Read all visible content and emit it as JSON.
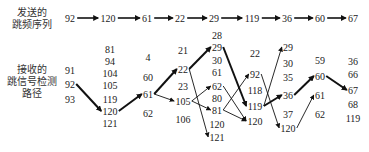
{
  "labels": {
    "sent": [
      "发送的",
      "跳频序列"
    ],
    "received": [
      "接收的",
      "跳信号检测",
      "路径"
    ]
  },
  "sent_sequence": {
    "y": 18,
    "nodes": [
      {
        "value": "92",
        "x": 70
      },
      {
        "value": "120",
        "x": 108
      },
      {
        "value": "61",
        "x": 147
      },
      {
        "value": "22",
        "x": 180
      },
      {
        "value": "29",
        "x": 214
      },
      {
        "value": "119",
        "x": 252
      },
      {
        "value": "36",
        "x": 287
      },
      {
        "value": "60",
        "x": 320
      },
      {
        "value": "67",
        "x": 353
      }
    ]
  },
  "columns": [
    {
      "x": 70,
      "values": [
        {
          "v": "91",
          "y": 70
        },
        {
          "v": "92",
          "y": 84
        },
        {
          "v": "93",
          "y": 99
        }
      ]
    },
    {
      "x": 110,
      "values": [
        {
          "v": "81",
          "y": 49
        },
        {
          "v": "94",
          "y": 61
        },
        {
          "v": "104",
          "y": 73
        },
        {
          "v": "105",
          "y": 85
        },
        {
          "v": "119",
          "y": 99
        },
        {
          "v": "120",
          "y": 111
        },
        {
          "v": "121",
          "y": 123
        }
      ]
    },
    {
      "x": 148,
      "values": [
        {
          "v": "4",
          "y": 57
        },
        {
          "v": "60",
          "y": 77
        },
        {
          "v": "61",
          "y": 94
        },
        {
          "v": "62",
          "y": 113
        }
      ]
    },
    {
      "x": 183,
      "values": [
        {
          "v": "21",
          "y": 50
        },
        {
          "v": "22",
          "y": 69
        },
        {
          "v": "23",
          "y": 86
        },
        {
          "v": "105",
          "y": 101
        },
        {
          "v": "106",
          "y": 119
        }
      ]
    },
    {
      "x": 217,
      "values": [
        {
          "v": "28",
          "y": 35
        },
        {
          "v": "29",
          "y": 47
        },
        {
          "v": "30",
          "y": 60
        },
        {
          "v": "61",
          "y": 72
        },
        {
          "v": "62",
          "y": 86
        },
        {
          "v": "80",
          "y": 98
        },
        {
          "v": "81",
          "y": 110
        },
        {
          "v": "120",
          "y": 124
        },
        {
          "v": "121",
          "y": 137
        }
      ]
    },
    {
      "x": 255,
      "values": [
        {
          "v": "22",
          "y": 53
        },
        {
          "v": "92",
          "y": 74
        },
        {
          "v": "118",
          "y": 90
        },
        {
          "v": "119",
          "y": 106
        },
        {
          "v": "120",
          "y": 121
        }
      ]
    },
    {
      "x": 288,
      "values": [
        {
          "v": "29",
          "y": 47
        },
        {
          "v": "30",
          "y": 63
        },
        {
          "v": "35",
          "y": 77
        },
        {
          "v": "36",
          "y": 95
        },
        {
          "v": "37",
          "y": 114
        },
        {
          "v": "120",
          "y": 128
        }
      ]
    },
    {
      "x": 320,
      "values": [
        {
          "v": "59",
          "y": 60
        },
        {
          "v": "60",
          "y": 76
        },
        {
          "v": "61",
          "y": 95
        },
        {
          "v": "62",
          "y": 114
        }
      ]
    },
    {
      "x": 353,
      "values": [
        {
          "v": "36",
          "y": 61
        },
        {
          "v": "66",
          "y": 74
        },
        {
          "v": "67",
          "y": 90
        },
        {
          "v": "68",
          "y": 104
        },
        {
          "v": "119",
          "y": 118
        }
      ]
    }
  ],
  "edges": [
    {
      "from": [
        0,
        1
      ],
      "to": [
        1,
        5
      ],
      "thick": true
    },
    {
      "from": [
        1,
        5
      ],
      "to": [
        2,
        2
      ],
      "thick": true
    },
    {
      "from": [
        2,
        2
      ],
      "to": [
        3,
        1
      ],
      "thick": true
    },
    {
      "from": [
        2,
        2
      ],
      "to": [
        3,
        3
      ],
      "thick": false
    },
    {
      "from": [
        3,
        1
      ],
      "to": [
        4,
        1
      ],
      "thick": true
    },
    {
      "from": [
        3,
        1
      ],
      "to": [
        4,
        8
      ],
      "thick": false
    },
    {
      "from": [
        3,
        3
      ],
      "to": [
        4,
        4
      ],
      "thick": false
    },
    {
      "from": [
        3,
        3
      ],
      "to": [
        4,
        6
      ],
      "thick": false
    },
    {
      "from": [
        4,
        1
      ],
      "to": [
        5,
        3
      ],
      "thick": true
    },
    {
      "from": [
        4,
        4
      ],
      "to": [
        5,
        4
      ],
      "thick": false
    },
    {
      "from": [
        4,
        6
      ],
      "to": [
        5,
        1
      ],
      "thick": false
    },
    {
      "from": [
        4,
        6
      ],
      "to": [
        5,
        4
      ],
      "thick": false
    },
    {
      "from": [
        5,
        3
      ],
      "to": [
        6,
        3
      ],
      "thick": true
    },
    {
      "from": [
        5,
        3
      ],
      "to": [
        6,
        0
      ],
      "thick": false
    },
    {
      "from": [
        5,
        1
      ],
      "to": [
        6,
        5
      ],
      "thick": false
    },
    {
      "from": [
        6,
        3
      ],
      "to": [
        7,
        1
      ],
      "thick": true
    },
    {
      "from": [
        6,
        5
      ],
      "to": [
        7,
        2
      ],
      "thick": false
    },
    {
      "from": [
        7,
        1
      ],
      "to": [
        8,
        2
      ],
      "thick": true
    }
  ],
  "colors": {
    "text": "#222222",
    "arrow": "#111111",
    "background": "#ffffff"
  }
}
